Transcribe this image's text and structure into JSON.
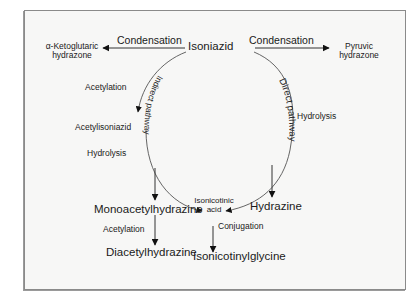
{
  "diagram": {
    "nodes": {
      "isoniazid": "Isoniazid",
      "alpha_keto_line1": "α-Ketoglutaric",
      "alpha_keto_line2": "hydrazone",
      "pyruvic_line1": "Pyruvic",
      "pyruvic_line2": "hydrazone",
      "acetylisoniazid": "Acetylisoniazid",
      "isonicotinic_line1": "Isonicotinic",
      "isonicotinic_line2": "acid",
      "monoacetylhydrazine": "Monoacetylhydrazine",
      "diacetylhydrazine": "Diacetylhydrazine",
      "hydrazine": "Hydrazine",
      "isonicotinylglycine": "Isonicotinylglycine"
    },
    "edge_labels": {
      "condensation_left": "Condensation",
      "condensation_right": "Condensation",
      "acetylation_1": "Acetylation",
      "hydrolysis_left": "Hydrolysis",
      "hydrolysis_right": "Hydrolysis",
      "acetylation_2": "Acetylation",
      "conjugation": "Conjugation"
    },
    "pathways": {
      "indirect": "Indirect pathway",
      "direct": "Direct pathway"
    },
    "colors": {
      "frame_bg": "#f7f7f6",
      "frame_border": "#8a8a8a",
      "line": "#333333",
      "arc": "#555555"
    }
  }
}
